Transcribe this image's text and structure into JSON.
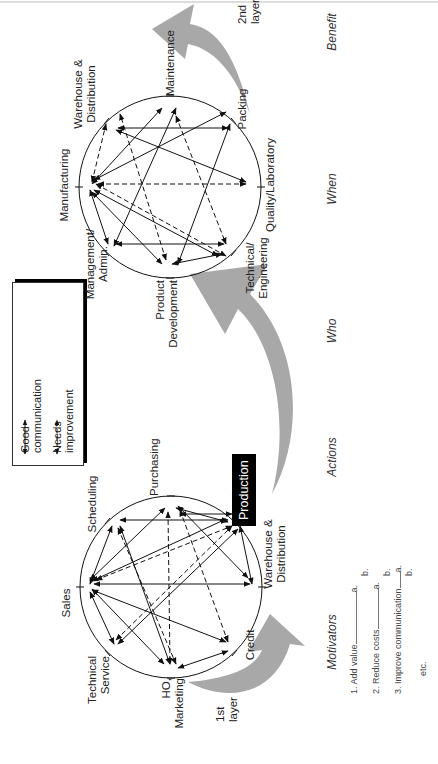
{
  "legend": {
    "items": [
      {
        "label_line1": "Good",
        "label_line2": "communication",
        "style": "solid"
      },
      {
        "label_line1": "Needs",
        "label_line2": "improvement",
        "style": "dashed"
      }
    ]
  },
  "layer1": {
    "label_line1": "1st",
    "label_line2": "layer",
    "highlight_node": "Production",
    "nodes": [
      {
        "id": "sales",
        "line1": "Sales",
        "line2": ""
      },
      {
        "id": "scheduling",
        "line1": "Scheduling",
        "line2": ""
      },
      {
        "id": "purchasing",
        "line1": "Purchasing",
        "line2": ""
      },
      {
        "id": "production",
        "line1": "Production",
        "line2": ""
      },
      {
        "id": "warehouse",
        "line1": "Warehouse &",
        "line2": "Distribution"
      },
      {
        "id": "credit",
        "line1": "Credit",
        "line2": ""
      },
      {
        "id": "ho_marketing",
        "line1": "HO,",
        "line2": "Marketing"
      },
      {
        "id": "tech_service",
        "line1": "Technical",
        "line2": "Service"
      }
    ]
  },
  "layer2": {
    "label_line1": "2nd",
    "label_line2": "layer",
    "nodes": [
      {
        "id": "manufacturing",
        "line1": "Manufacturing",
        "line2": ""
      },
      {
        "id": "warehouse",
        "line1": "Warehouse &",
        "line2": "Distribution"
      },
      {
        "id": "maintenance",
        "line1": "Maintenance",
        "line2": ""
      },
      {
        "id": "packing",
        "line1": "Packing",
        "line2": ""
      },
      {
        "id": "quality",
        "line1": "Quality/Laboratory",
        "line2": ""
      },
      {
        "id": "tech_eng",
        "line1": "Technical/",
        "line2": "Engineering"
      },
      {
        "id": "product_dev",
        "line1": "Product",
        "line2": "Development"
      },
      {
        "id": "management",
        "line1": "Management/",
        "line2": "Admin."
      }
    ]
  },
  "columns": [
    "Motivators",
    "Actions",
    "Who",
    "When",
    "Benefit"
  ],
  "motivators": [
    {
      "label": "1. Add value",
      "subs": [
        "a.",
        "b."
      ]
    },
    {
      "label": "2. Reduce costs",
      "subs": [
        "a.",
        "b."
      ]
    },
    {
      "label": "3. Improve communication",
      "subs": [
        "a.",
        "b."
      ]
    }
  ],
  "motivators_more": "etc.",
  "colors": {
    "arrow_fill": "#a8a8a8",
    "line": "#111111",
    "production_bg": "#000000"
  }
}
